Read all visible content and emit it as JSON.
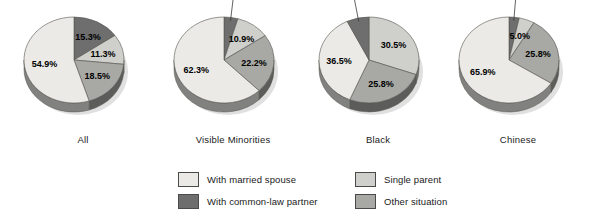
{
  "chart_data": {
    "type": "pie",
    "title": "",
    "subtitle": "",
    "xlabel": "",
    "ylabel": "",
    "legend_position": "bottom",
    "grid": false,
    "units": "percent",
    "categories": [
      "With married spouse",
      "With common-law partner",
      "Single parent",
      "Other situation"
    ],
    "colors": {
      "with_married_spouse": "#ebeae6",
      "with_common_law_partner": "#6e6e6e",
      "single_parent": "#cfcfcb",
      "other_situation": "#a8a8a4"
    },
    "charts": [
      {
        "name": "All",
        "slices": [
          {
            "label": "With common-law partner",
            "value": 15.3,
            "display": "15.3%",
            "color_key": "with_common_law_partner",
            "label_placement": "inside"
          },
          {
            "label": "Single parent",
            "value": 11.3,
            "display": "11.3%",
            "color_key": "single_parent",
            "label_placement": "inside"
          },
          {
            "label": "Other situation",
            "value": 18.5,
            "display": "18.5%",
            "color_key": "other_situation",
            "label_placement": "inside"
          },
          {
            "label": "With married spouse",
            "value": 54.9,
            "display": "54.9%",
            "color_key": "with_married_spouse",
            "label_placement": "inside"
          }
        ]
      },
      {
        "name": "Visible Minorities",
        "slices": [
          {
            "label": "With common-law partner",
            "value": 4.5,
            "display": "4.5%",
            "color_key": "with_common_law_partner",
            "label_placement": "outside"
          },
          {
            "label": "Single parent",
            "value": 10.9,
            "display": "10.9%",
            "color_key": "single_parent",
            "label_placement": "inside"
          },
          {
            "label": "Other situation",
            "value": 22.2,
            "display": "22.2%",
            "color_key": "other_situation",
            "label_placement": "inside"
          },
          {
            "label": "With married spouse",
            "value": 62.3,
            "display": "62.3%",
            "color_key": "with_married_spouse",
            "label_placement": "inside"
          }
        ]
      },
      {
        "name": "Black",
        "slices": [
          {
            "label": "Single parent",
            "value": 30.5,
            "display": "30.5%",
            "color_key": "single_parent",
            "label_placement": "inside"
          },
          {
            "label": "Other situation",
            "value": 25.8,
            "display": "25.8%",
            "color_key": "other_situation",
            "label_placement": "inside"
          },
          {
            "label": "With married spouse",
            "value": 36.5,
            "display": "36.5%",
            "color_key": "with_married_spouse",
            "label_placement": "inside"
          },
          {
            "label": "With common-law partner",
            "value": 7.2,
            "display": "7.2%",
            "color_key": "with_common_law_partner",
            "label_placement": "outside"
          }
        ]
      },
      {
        "name": "Chinese",
        "slices": [
          {
            "label": "With common-law partner",
            "value": 3.3,
            "display": "3.3%",
            "color_key": "with_common_law_partner",
            "label_placement": "outside"
          },
          {
            "label": "Single parent",
            "value": 5.0,
            "display": "5.0%",
            "color_key": "single_parent",
            "label_placement": "inside"
          },
          {
            "label": "Other situation",
            "value": 25.8,
            "display": "25.8%",
            "color_key": "other_situation",
            "label_placement": "inside"
          },
          {
            "label": "With married spouse",
            "value": 65.9,
            "display": "65.9%",
            "color_key": "with_married_spouse",
            "label_placement": "inside"
          }
        ]
      }
    ]
  },
  "legend": {
    "items": [
      {
        "label": "With married spouse",
        "color_key": "with_married_spouse"
      },
      {
        "label": "With common-law partner",
        "color_key": "with_common_law_partner"
      },
      {
        "label": "Single parent",
        "color_key": "single_parent"
      },
      {
        "label": "Other situation",
        "color_key": "other_situation"
      }
    ]
  },
  "captions": {
    "chart_1": "All",
    "chart_2": "Visible Minorities",
    "chart_3": "Black",
    "chart_4": "Chinese"
  }
}
